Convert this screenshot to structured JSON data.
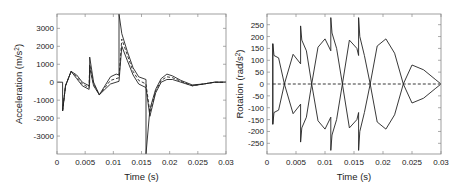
{
  "chart_data": [
    {
      "type": "line",
      "title": "",
      "xlabel": "Time (s)",
      "ylabel": "Acceleration (m/s^2)",
      "ylabel_main": "Acceleration (m/s",
      "ylabel_sup": "2",
      "ylabel_end": ")",
      "xlim": [
        0,
        0.03
      ],
      "ylim": [
        -4000,
        3800
      ],
      "xticks": [
        0,
        0.005,
        0.01,
        0.015,
        0.02,
        0.025,
        0.03
      ],
      "xtick_labels": [
        "0",
        "0.005",
        "0.01",
        "0.015",
        "0.02",
        "0.025",
        "0.03"
      ],
      "yticks": [
        3000,
        2000,
        1000,
        0,
        -1000,
        -2000,
        -3000
      ],
      "ytick_labels": [
        "3000",
        "2000",
        "1000",
        "0",
        "-1000",
        "-2000",
        "-3000"
      ],
      "grid": false,
      "legend": null,
      "series": [
        {
          "name": "upper",
          "style": "solid",
          "x": [
            0,
            0.001,
            0.001,
            0.0015,
            0.0025,
            0.0035,
            0.0045,
            0.0057,
            0.0058,
            0.0058,
            0.0065,
            0.0075,
            0.0085,
            0.0095,
            0.0105,
            0.011,
            0.011,
            0.0115,
            0.0125,
            0.0135,
            0.0145,
            0.0158,
            0.0158,
            0.0165,
            0.0175,
            0.0185,
            0.0195,
            0.0205,
            0.022,
            0.024,
            0.026,
            0.028,
            0.03
          ],
          "y": [
            0,
            0,
            -1600,
            -200,
            600,
            400,
            0,
            -200,
            0,
            1400,
            0,
            -700,
            -200,
            300,
            450,
            400,
            3800,
            2700,
            1700,
            800,
            300,
            150,
            -4000,
            -1500,
            -400,
            200,
            450,
            350,
            100,
            -150,
            -100,
            0,
            0
          ]
        },
        {
          "name": "middle",
          "style": "dashed",
          "x": [
            0.001,
            0.0015,
            0.0025,
            0.0035,
            0.0045,
            0.0057,
            0.0058,
            0.0065,
            0.0075,
            0.0085,
            0.0095,
            0.011,
            0.0115,
            0.0125,
            0.0135,
            0.0145,
            0.0158,
            0.0165,
            0.0175,
            0.0185,
            0.0195,
            0.0205,
            0.022,
            0.024,
            0.026,
            0.028,
            0.03
          ],
          "y": [
            -1600,
            -200,
            600,
            300,
            -100,
            -300,
            1000,
            -100,
            -700,
            -300,
            100,
            250,
            2400,
            1500,
            600,
            100,
            -100,
            -1700,
            -500,
            100,
            300,
            250,
            50,
            -200,
            -100,
            0,
            0
          ]
        },
        {
          "name": "lower",
          "style": "solid",
          "x": [
            0.001,
            0.0015,
            0.0025,
            0.0035,
            0.0045,
            0.0057,
            0.0058,
            0.0065,
            0.0075,
            0.0085,
            0.0095,
            0.011,
            0.0115,
            0.0125,
            0.0135,
            0.0145,
            0.0158,
            0.0165,
            0.0175,
            0.0185,
            0.0195,
            0.0205,
            0.022,
            0.024,
            0.026,
            0.028,
            0.03
          ],
          "y": [
            -1600,
            -200,
            600,
            200,
            -200,
            -400,
            800,
            -200,
            -700,
            -400,
            -100,
            50,
            2000,
            1200,
            400,
            -100,
            -300,
            -1900,
            -600,
            0,
            150,
            150,
            0,
            -200,
            -100,
            0,
            0
          ]
        }
      ]
    },
    {
      "type": "line",
      "title": "",
      "xlabel": "Time (s)",
      "ylabel": "Rotation (rad/s^2)",
      "ylabel_main": "Rotation (rad/s",
      "ylabel_sup": "2",
      "ylabel_end": ")",
      "xlim": [
        0,
        0.03
      ],
      "ylim": [
        -295,
        295
      ],
      "xticks": [
        0,
        0.005,
        0.01,
        0.015,
        0.02,
        0.025,
        0.03
      ],
      "xtick_labels": [
        "0",
        "0.005",
        "0.01",
        "0.015",
        "0.02",
        "0.025",
        "0.03"
      ],
      "yticks": [
        250,
        200,
        150,
        100,
        50,
        0,
        -50,
        -100,
        -150,
        -200,
        -250
      ],
      "ytick_labels": [
        "250",
        "200",
        "150",
        "100",
        "50",
        "0",
        "-50",
        "-100",
        "-150",
        "-200",
        "-250"
      ],
      "grid": false,
      "legend": null,
      "series": [
        {
          "name": "upper-envelope",
          "style": "solid",
          "x": [
            0.001,
            0.001,
            0.0012,
            0.002,
            0.003,
            0.0045,
            0.0058,
            0.0058,
            0.006,
            0.0068,
            0.0077,
            0.0088,
            0.01,
            0.011,
            0.011,
            0.0112,
            0.012,
            0.013,
            0.0142,
            0.0155,
            0.0158,
            0.0158,
            0.016,
            0.0168,
            0.0178,
            0.019,
            0.0205,
            0.022,
            0.0235,
            0.025,
            0.027,
            0.029,
            0.03
          ],
          "y": [
            -170,
            170,
            120,
            110,
            0,
            125,
            85,
            245,
            185,
            140,
            0,
            155,
            190,
            140,
            280,
            215,
            150,
            0,
            185,
            150,
            120,
            280,
            200,
            120,
            0,
            160,
            190,
            130,
            0,
            80,
            60,
            20,
            0
          ]
        },
        {
          "name": "lower-envelope",
          "style": "solid",
          "x": [
            0.001,
            0.001,
            0.0012,
            0.002,
            0.003,
            0.0045,
            0.0058,
            0.0058,
            0.006,
            0.0068,
            0.0077,
            0.0088,
            0.01,
            0.011,
            0.011,
            0.0112,
            0.012,
            0.013,
            0.0142,
            0.0155,
            0.0158,
            0.0158,
            0.016,
            0.0168,
            0.0178,
            0.019,
            0.0205,
            0.022,
            0.0235,
            0.025,
            0.027,
            0.029,
            0.03
          ],
          "y": [
            170,
            -170,
            -120,
            -110,
            0,
            -125,
            -85,
            -245,
            -185,
            -140,
            0,
            -155,
            -190,
            -140,
            -280,
            -215,
            -150,
            0,
            -185,
            -150,
            -120,
            -280,
            -200,
            -120,
            0,
            -160,
            -190,
            -130,
            0,
            -80,
            -60,
            -20,
            0
          ]
        },
        {
          "name": "mean",
          "style": "dashed",
          "x": [
            0.001,
            0.03
          ],
          "y": [
            0,
            0
          ]
        }
      ]
    }
  ]
}
